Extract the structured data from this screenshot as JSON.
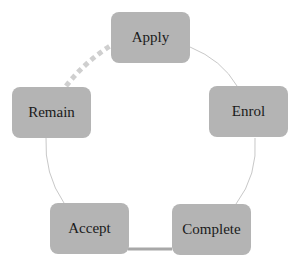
{
  "diagram": {
    "type": "cycle",
    "colors": {
      "node_fill": "#b4b4b4",
      "thin_link": "#c8c8c8",
      "thick_link": "#a8a8a8",
      "dotted_link": "#cfcfcf",
      "text": "#1a1a1a"
    },
    "nodes": [
      {
        "id": "apply",
        "label": "Apply"
      },
      {
        "id": "enrol",
        "label": "Enrol"
      },
      {
        "id": "complete",
        "label": "Complete"
      },
      {
        "id": "accept",
        "label": "Accept"
      },
      {
        "id": "remain",
        "label": "Remain"
      }
    ],
    "links": [
      {
        "from": "apply",
        "to": "enrol",
        "style": "thin"
      },
      {
        "from": "enrol",
        "to": "complete",
        "style": "thin"
      },
      {
        "from": "complete",
        "to": "accept",
        "style": "thick"
      },
      {
        "from": "accept",
        "to": "remain",
        "style": "thin"
      },
      {
        "from": "remain",
        "to": "apply",
        "style": "dotted"
      }
    ]
  }
}
